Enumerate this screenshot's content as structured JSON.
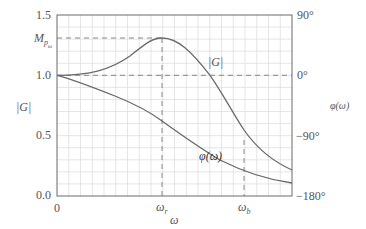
{
  "chart_data": {
    "type": "line",
    "title": "",
    "xlabel": "ω",
    "ylabel_left": "|G|",
    "ylabel_right": "φ(ω)",
    "left_axis": {
      "ticks": [
        "0.0",
        "0.5",
        "1.0",
        "1.5"
      ],
      "values": [
        0.0,
        0.5,
        1.0,
        1.5
      ],
      "range": [
        0.0,
        1.5
      ],
      "special_tick": "M_{p_ω}",
      "special_value": 1.32
    },
    "right_axis": {
      "ticks": [
        "90°",
        "0°",
        "−90°",
        "−180°"
      ],
      "values": [
        90,
        0,
        -90,
        -180
      ],
      "range": [
        -180,
        90
      ]
    },
    "x_axis": {
      "ticks": [
        "0",
        "ω_r",
        "ω_b"
      ],
      "positions_fraction": [
        0.0,
        0.447,
        0.796
      ]
    },
    "grid": true,
    "reference_lines": [
      {
        "type": "horizontal-dashed",
        "value": 1.0,
        "label": "|G| = 1 / φ = 0°"
      },
      {
        "type": "horizontal-dashed",
        "value": 1.32,
        "label": "M_p"
      },
      {
        "type": "vertical-dashed",
        "at": "ω_r"
      },
      {
        "type": "vertical-dashed",
        "at": "ω_b"
      }
    ],
    "x": [
      0.0,
      0.1,
      0.2,
      0.3,
      0.4,
      0.447,
      0.5,
      0.6,
      0.65,
      0.7,
      0.8,
      0.9,
      1.0
    ],
    "series": [
      {
        "name": "|G|",
        "axis": "left",
        "values": [
          1.0,
          1.01,
          1.04,
          1.11,
          1.24,
          1.32,
          1.3,
          1.16,
          1.0,
          0.88,
          0.62,
          0.4,
          0.22
        ]
      },
      {
        "name": "φ(ω)",
        "axis": "right",
        "values": [
          0,
          -6,
          -16,
          -30,
          -50,
          -62,
          -75,
          -99,
          -112,
          -123,
          -142,
          -155,
          -163
        ]
      }
    ],
    "annotations": [
      {
        "text": "|G|",
        "near": "magnitude curve after peak"
      },
      {
        "text": "φ(ω)",
        "near": "phase curve"
      }
    ]
  },
  "labels": {
    "y_left_1_5": "1.5",
    "y_left_mp": "M",
    "y_left_mp_sub": "p",
    "y_left_mp_subsub": "ω",
    "y_left_1_0": "1.0",
    "y_left_0_5": "0.5",
    "y_left_0_0": "0.0",
    "y_left_title": "|G|",
    "y_right_90": "90°",
    "y_right_0": "0°",
    "y_right_m90": "−90°",
    "y_right_m180": "−180°",
    "y_right_title": "φ(ω)",
    "x_0": "0",
    "x_wr": "ω",
    "x_wr_sub": "r",
    "x_wb": "ω",
    "x_wb_sub": "b",
    "x_title": "ω",
    "curve_mag": "|G|",
    "curve_phase": "φ(ω)"
  },
  "colors": {
    "curve": "#6a6a6a",
    "axis": "#6a6a6a",
    "grid": "#dcdcdc",
    "dash": "#7a7a7a",
    "text": "#555555"
  }
}
